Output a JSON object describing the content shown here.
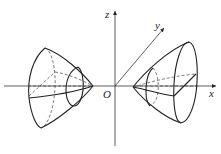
{
  "figure": {
    "axes": {
      "x_label": "x",
      "y_label": "y",
      "z_label": "z",
      "origin_label": "O"
    }
  }
}
